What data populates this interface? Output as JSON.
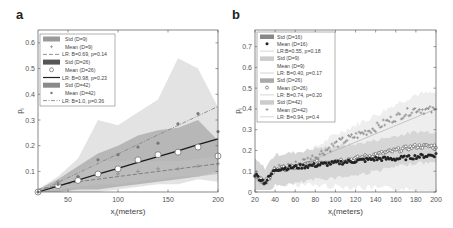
{
  "chart_data": [
    {
      "panel": "a",
      "type": "line",
      "title": "",
      "xlabel": "x_i(meters)",
      "ylabel": "p_i",
      "xlim": [
        20,
        200
      ],
      "ylim": [
        0.02,
        0.65
      ],
      "xticks": [
        50,
        100,
        150,
        200
      ],
      "yticks": [
        0.1,
        0.2,
        0.3,
        0.4,
        0.5,
        0.6
      ],
      "legend_position": "upper left",
      "legend": [
        "Std (D=9)",
        "Mean (D=9)",
        "LR: B=0.69, p=0.14",
        "Std (D=26)",
        "Mean (D=26)",
        "LR: B=0.98, p=0.23",
        "Std (D=42)",
        "Mean (D=42)",
        "LR: B=1.0, p=0.36"
      ],
      "x": [
        20,
        40,
        60,
        80,
        100,
        120,
        140,
        160,
        180,
        200
      ],
      "series": [
        {
          "name": "Mean (D=9)",
          "marker": "+",
          "values": [
            0.02,
            0.06,
            0.08,
            0.09,
            0.09,
            0.1,
            0.11,
            0.11,
            0.12,
            0.13
          ]
        },
        {
          "name": "Mean (D=26)",
          "marker": "o",
          "values": [
            0.02,
            0.045,
            0.065,
            0.09,
            0.11,
            0.145,
            0.165,
            0.175,
            0.195,
            0.16
          ]
        },
        {
          "name": "Mean (D=42)",
          "marker": "*",
          "values": [
            0.02,
            0.05,
            0.08,
            0.145,
            0.165,
            0.195,
            0.21,
            0.285,
            0.325,
            0.255
          ]
        },
        {
          "name": "LR: B=0.69, p=0.14",
          "style": "dashed",
          "values": [
            0.03,
            0.045,
            0.06,
            0.07,
            0.08,
            0.09,
            0.1,
            0.11,
            0.12,
            0.13
          ]
        },
        {
          "name": "LR: B=0.98, p=0.23",
          "style": "solid",
          "values": [
            0.02,
            0.043,
            0.066,
            0.09,
            0.112,
            0.135,
            0.158,
            0.18,
            0.204,
            0.227
          ]
        },
        {
          "name": "LR: B=1.0, p=0.36",
          "style": "dash-dot",
          "values": [
            0.02,
            0.057,
            0.094,
            0.131,
            0.168,
            0.205,
            0.242,
            0.279,
            0.316,
            0.353
          ]
        }
      ],
      "std_bands": [
        {
          "name": "Std (D=9)",
          "upper": [
            0.03,
            0.06,
            0.1,
            0.14,
            0.14,
            0.14,
            0.14,
            0.14,
            0.15,
            0.16
          ],
          "lower": [
            0.02,
            0.03,
            0.04,
            0.05,
            0.05,
            0.06,
            0.07,
            0.08,
            0.08,
            0.09
          ]
        },
        {
          "name": "Std (D=26)",
          "upper": [
            0.03,
            0.07,
            0.12,
            0.17,
            0.2,
            0.24,
            0.26,
            0.27,
            0.3,
            0.22
          ],
          "lower": [
            0.02,
            0.02,
            0.03,
            0.03,
            0.04,
            0.05,
            0.06,
            0.07,
            0.08,
            0.1
          ]
        },
        {
          "name": "Std (D=42)",
          "upper": [
            0.03,
            0.08,
            0.15,
            0.3,
            0.28,
            0.33,
            0.38,
            0.54,
            0.5,
            0.35
          ],
          "lower": [
            0.02,
            0.02,
            0.02,
            0.02,
            0.03,
            0.04,
            0.05,
            0.05,
            0.07,
            0.06
          ]
        }
      ]
    },
    {
      "panel": "b",
      "type": "scatter",
      "title": "",
      "xlabel": "x_i(meters)",
      "ylabel": "p_i",
      "xlim": [
        20,
        200
      ],
      "ylim": [
        0,
        0.78
      ],
      "xticks": [
        20,
        40,
        60,
        80,
        100,
        120,
        140,
        160,
        180,
        200
      ],
      "yticks": [
        0,
        0.1,
        0.2,
        0.3,
        0.4,
        0.5,
        0.6,
        0.7
      ],
      "legend_position": "upper left",
      "legend": [
        "Std (D=16)",
        "Mean (D=16)",
        "LR:B=0.55, p=0.18",
        "Std (D=9)",
        "Mean (D=9)",
        "LR: B=0.40, p=0.17",
        "Std (D=26)",
        "Mean (D=26)",
        "LR: B=0.74, p=0.20",
        "Std (D=42)",
        "Mean (D=42)",
        "LR: B=0.94, p=0.4"
      ],
      "x": [
        20,
        30,
        40,
        60,
        80,
        100,
        120,
        140,
        160,
        180,
        200
      ],
      "series": [
        {
          "name": "Mean (D=16)",
          "marker": "filled-circle",
          "values": [
            0.085,
            0.045,
            0.11,
            0.12,
            0.13,
            0.14,
            0.15,
            0.16,
            0.16,
            0.17,
            0.18
          ]
        },
        {
          "name": "Mean (D=26)",
          "marker": "open-circle",
          "values": [
            0.085,
            0.045,
            0.11,
            0.12,
            0.14,
            0.15,
            0.16,
            0.18,
            0.2,
            0.22,
            0.22
          ]
        },
        {
          "name": "Mean (D=42)",
          "marker": "+",
          "values": [
            0.085,
            0.045,
            0.11,
            0.13,
            0.17,
            0.23,
            0.27,
            0.31,
            0.36,
            0.4,
            0.39
          ]
        }
      ],
      "regression_lines": [
        {
          "name": "LR: B=0.94, p=0.4",
          "x": [
            60,
            200
          ],
          "y": [
            0.12,
            0.4
          ]
        }
      ]
    }
  ],
  "panels": {
    "a": {
      "label": "a",
      "ylabel": "p",
      "ylabel_sub": "i",
      "xlabel": "x",
      "xlabel_sub": "i",
      "xlabel_rest": "(meters)",
      "xticks": [
        "50",
        "100",
        "150",
        "200"
      ],
      "yticks": [
        "0.1",
        "0.2",
        "0.3",
        "0.4",
        "0.5",
        "0.6"
      ],
      "legend": [
        "Std (D=9)",
        "Mean (D=9)",
        "LR: B=0.69, p=0.14",
        "Std (D=26)",
        "Mean (D=26)",
        "LR: B=0.98, p=0.23",
        "Std (D=42)",
        "Mean (D=42)",
        "LR: B=1.0, p=0.36"
      ]
    },
    "b": {
      "label": "b",
      "ylabel": "p",
      "ylabel_sub": "i",
      "xlabel": "x",
      "xlabel_sub": "i",
      "xlabel_rest": "(meters)",
      "xticks": [
        "20",
        "40",
        "60",
        "80",
        "100",
        "120",
        "140",
        "160",
        "180",
        "200"
      ],
      "yticks": [
        "0",
        "0.1",
        "0.2",
        "0.3",
        "0.4",
        "0.5",
        "0.6",
        "0.7"
      ],
      "legend": [
        "Std (D=16)",
        "Mean (D=16)",
        "LR:B=0.55, p=0.18",
        "Std (D=9)",
        "Mean (D=9)",
        "LR: B=0.40, p=0.17",
        "Std (D=26)",
        "Mean (D=26)",
        "LR: B=0.74, p=0.20",
        "Std (D=42)",
        "Mean (D=42)",
        "LR: B=0.94, p=0.4"
      ]
    }
  },
  "colors": {
    "band_light": "#d9d9d9",
    "band_mid": "#bdbdbd",
    "band_dark": "#a8a8a8",
    "line_dark": "#1a1a1a",
    "line_mid": "#7a7a7a",
    "frame": "#555555"
  }
}
